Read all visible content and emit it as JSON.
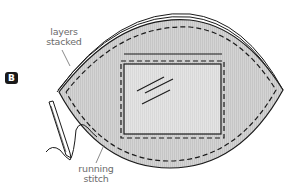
{
  "figure": {
    "step_badge": "B",
    "labels": {
      "layers_stacked": [
        "layers",
        "stacked"
      ],
      "running_stitch": [
        "running",
        "stitch"
      ]
    },
    "colors": {
      "fabric_fill": "#d2d2d2",
      "fabric_stripe": "#c4c4c4",
      "window_fill": "#e2e2e2",
      "outline": "#1a1a1a",
      "label_text": "#6b6b6b",
      "badge_bg": "#1a1a1a",
      "badge_text": "#ffffff"
    }
  }
}
